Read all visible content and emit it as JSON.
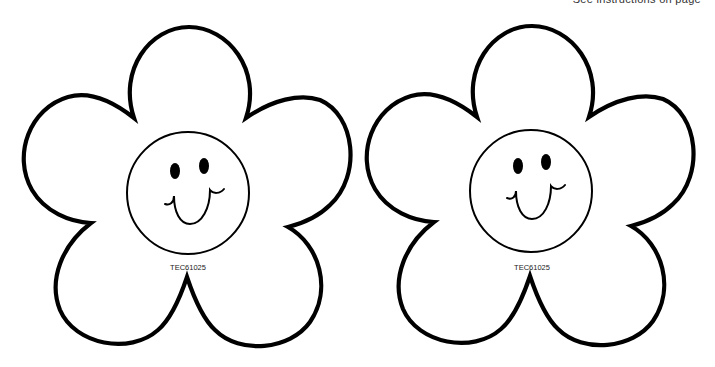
{
  "page": {
    "top_note": "See instructions on page"
  },
  "colors": {
    "outline": "#000000",
    "background": "#ffffff"
  },
  "flowers": [
    {
      "id": "flower-left",
      "label": "TEC61025",
      "face": "smiley-face",
      "petals": 5
    },
    {
      "id": "flower-right",
      "label": "TEC61025",
      "face": "smiley-face",
      "petals": 5
    }
  ]
}
